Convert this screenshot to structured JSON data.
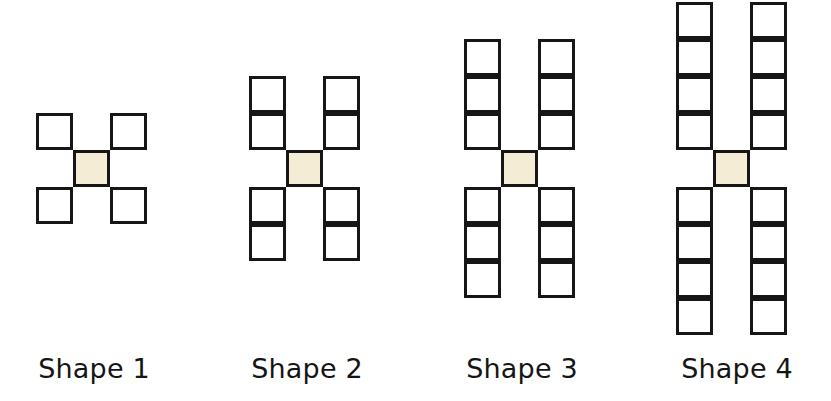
{
  "page": {
    "background_color": "#ffffff",
    "width": 831,
    "height": 401
  },
  "style": {
    "cell_size": 37,
    "border_width": 3,
    "border_color": "#161616",
    "cell_fill": "#ffffff",
    "center_fill": "#f5ecd5",
    "label_color": "#151515",
    "label_font_size": 27
  },
  "chart_data": {
    "type": "diagram",
    "unit": "square tile",
    "categories": [
      "Shape 1",
      "Shape 2",
      "Shape 3",
      "Shape 4"
    ],
    "arm_lengths": [
      1,
      2,
      3,
      4
    ],
    "tile_counts": [
      5,
      9,
      13,
      17
    ],
    "grid_columns": [
      3,
      3,
      3,
      3
    ],
    "grid_rows": [
      3,
      5,
      7,
      9
    ],
    "rule": "tiles = 4n + 1",
    "common_difference": 4
  },
  "shapes": [
    {
      "id": "shape-1",
      "label": "Shape 1",
      "arm_length": 1,
      "tile_count": 5,
      "left": 36,
      "top": 113,
      "cols": 3,
      "rows": 3,
      "center_col": 1,
      "center_row": 1,
      "label_left": 0,
      "label_top": 353,
      "label_width": 188
    },
    {
      "id": "shape-2",
      "label": "Shape 2",
      "arm_length": 2,
      "tile_count": 9,
      "left": 249,
      "top": 76,
      "cols": 3,
      "rows": 5,
      "center_col": 1,
      "center_row": 2,
      "label_left": 213,
      "label_top": 353,
      "label_width": 188
    },
    {
      "id": "shape-3",
      "label": "Shape 3",
      "arm_length": 3,
      "tile_count": 13,
      "left": 464,
      "top": 39,
      "cols": 3,
      "rows": 7,
      "center_col": 1,
      "center_row": 3,
      "label_left": 428,
      "label_top": 353,
      "label_width": 188
    },
    {
      "id": "shape-4",
      "label": "Shape 4",
      "arm_length": 4,
      "tile_count": 17,
      "left": 676,
      "top": 2,
      "cols": 3,
      "rows": 9,
      "center_col": 1,
      "center_row": 4,
      "label_left": 643,
      "label_top": 353,
      "label_width": 188
    }
  ]
}
